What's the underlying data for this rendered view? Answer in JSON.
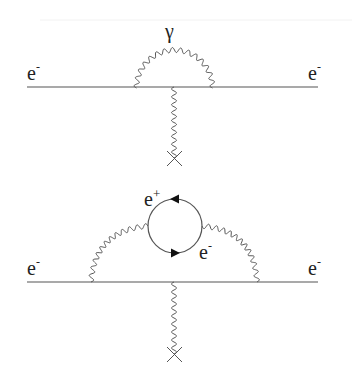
{
  "diagrams": [
    {
      "name": "electron vertex correction (self-energy photon loop)",
      "labels": {
        "incoming": "e",
        "incoming_sup": "-",
        "outgoing": "e",
        "outgoing_sup": "-",
        "photon": "γ"
      }
    },
    {
      "name": "vacuum polarization insertion in vertex correction",
      "labels": {
        "incoming": "e",
        "incoming_sup": "-",
        "outgoing": "e",
        "outgoing_sup": "-",
        "loop_top": "e",
        "loop_top_sup": "+",
        "loop_bottom": "e",
        "loop_bottom_sup": "-"
      }
    }
  ],
  "colors": {
    "line": "#555555",
    "text": "#222222",
    "background": "#ffffff"
  }
}
